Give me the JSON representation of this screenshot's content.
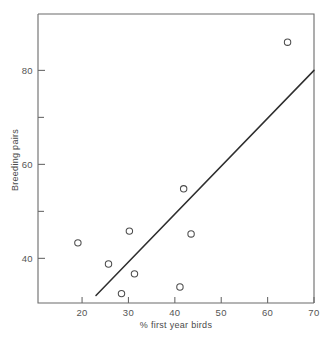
{
  "chart_data": {
    "type": "scatter",
    "title": "",
    "subtitle": "",
    "xlabel": "% first year birds",
    "ylabel": "Breeding pairs",
    "xlim": [
      10.5,
      70
    ],
    "ylim": [
      30.5,
      92
    ],
    "grid": false,
    "legend": "none",
    "x_ticks": [
      20,
      30,
      40,
      50,
      60,
      70
    ],
    "x_tick_labels": [
      "20",
      "30",
      "40",
      "50",
      "60",
      "70"
    ],
    "y_ticks": [
      40,
      50,
      60,
      70,
      80
    ],
    "y_tick_labels": [
      "40",
      "",
      "60",
      "",
      "80"
    ],
    "y_major_ticks": [
      40,
      60,
      80
    ],
    "y_minor_ticks": [
      50,
      70
    ],
    "marker": "open-circle",
    "marker_color": "#4d4d4d",
    "points": [
      {
        "x": 19.1,
        "y": 43.3
      },
      {
        "x": 25.7,
        "y": 38.8
      },
      {
        "x": 28.5,
        "y": 32.5
      },
      {
        "x": 30.2,
        "y": 45.8
      },
      {
        "x": 31.3,
        "y": 36.7
      },
      {
        "x": 41.1,
        "y": 33.9
      },
      {
        "x": 41.9,
        "y": 54.8
      },
      {
        "x": 43.5,
        "y": 45.2
      },
      {
        "x": 64.3,
        "y": 86.0
      }
    ],
    "series": [
      {
        "name": "Colonies",
        "x": [
          19.1,
          25.7,
          28.5,
          30.2,
          31.3,
          41.1,
          41.9,
          43.5,
          64.3
        ],
        "values": [
          43.3,
          38.8,
          32.5,
          45.8,
          36.7,
          33.9,
          54.8,
          45.2,
          86.0
        ]
      }
    ],
    "fit_line": {
      "type": "linear-regression",
      "x_start": 23.0,
      "y_start": 32.1,
      "x_end": 70.0,
      "y_end": 80.0,
      "color": "#2e2e2e"
    }
  },
  "axes": {
    "x_title": "% first year birds",
    "y_title": "Breeding pairs"
  },
  "colors": {
    "axis": "#6b6b6b",
    "marker": "#4d4d4d",
    "line": "#2e2e2e",
    "text": "#4a4a4a",
    "background": "#ffffff"
  }
}
